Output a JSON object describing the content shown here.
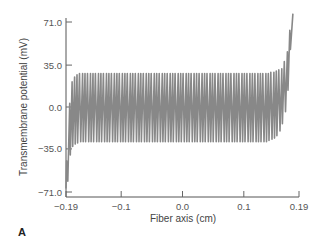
{
  "chart_data": {
    "type": "line",
    "title": "",
    "panel_label": "A",
    "xlabel": "Fiber axis (cm)",
    "ylabel": "Transmembrane potential (mV)",
    "xlim": [
      -0.19,
      0.19
    ],
    "ylim": [
      -71.0,
      71.0
    ],
    "x_ticks": [
      -0.19,
      -0.1,
      0.0,
      0.1,
      0.19
    ],
    "x_tick_labels": [
      "−0.19",
      "−0.1",
      "0.0",
      "0.1",
      "0.19"
    ],
    "y_ticks": [
      71.0,
      35.0,
      0.0,
      -35.0,
      -71.0
    ],
    "y_tick_labels": [
      "71.0",
      "35.0",
      "0.0",
      "−35.0",
      "−71.0"
    ],
    "grid": false,
    "legend": null,
    "line_color": "#888888",
    "series": [
      {
        "name": "Transmembrane potential",
        "points": [
          [
            -0.19,
            -68
          ],
          [
            -0.189,
            -45
          ],
          [
            -0.187,
            -62
          ],
          [
            -0.184,
            3
          ],
          [
            -0.183,
            -40
          ],
          [
            -0.18,
            21
          ],
          [
            -0.179,
            -33
          ],
          [
            -0.176,
            25
          ],
          [
            -0.175,
            -31
          ],
          [
            -0.172,
            27
          ],
          [
            -0.171,
            -30
          ],
          [
            -0.168,
            28
          ],
          [
            -0.166,
            -29
          ],
          [
            -0.163,
            28
          ],
          [
            -0.162,
            -29
          ],
          [
            -0.159,
            28
          ],
          [
            -0.158,
            -29
          ],
          [
            -0.155,
            28
          ],
          [
            -0.153,
            -29
          ],
          [
            -0.15,
            28
          ],
          [
            -0.149,
            -29
          ],
          [
            -0.146,
            28
          ],
          [
            -0.145,
            -29
          ],
          [
            -0.142,
            28
          ],
          [
            -0.14,
            -29
          ],
          [
            -0.137,
            28
          ],
          [
            -0.136,
            -29
          ],
          [
            -0.133,
            28
          ],
          [
            -0.132,
            -29
          ],
          [
            -0.129,
            28
          ],
          [
            -0.127,
            -29
          ],
          [
            -0.124,
            28
          ],
          [
            -0.123,
            -29
          ],
          [
            -0.12,
            28
          ],
          [
            -0.119,
            -29
          ],
          [
            -0.116,
            28
          ],
          [
            -0.114,
            -29
          ],
          [
            -0.111,
            28
          ],
          [
            -0.11,
            -29
          ],
          [
            -0.107,
            28
          ],
          [
            -0.106,
            -29
          ],
          [
            -0.103,
            28
          ],
          [
            -0.101,
            -29
          ],
          [
            -0.098,
            28
          ],
          [
            -0.097,
            -29
          ],
          [
            -0.094,
            28
          ],
          [
            -0.093,
            -29
          ],
          [
            -0.09,
            28
          ],
          [
            -0.088,
            -29
          ],
          [
            -0.085,
            28
          ],
          [
            -0.084,
            -29
          ],
          [
            -0.081,
            28
          ],
          [
            -0.08,
            -29
          ],
          [
            -0.077,
            28
          ],
          [
            -0.075,
            -29
          ],
          [
            -0.072,
            28
          ],
          [
            -0.071,
            -29
          ],
          [
            -0.068,
            28
          ],
          [
            -0.067,
            -29
          ],
          [
            -0.064,
            28
          ],
          [
            -0.062,
            -29
          ],
          [
            -0.059,
            28
          ],
          [
            -0.058,
            -29
          ],
          [
            -0.055,
            28
          ],
          [
            -0.054,
            -29
          ],
          [
            -0.051,
            28
          ],
          [
            -0.049,
            -29
          ],
          [
            -0.046,
            28
          ],
          [
            -0.045,
            -29
          ],
          [
            -0.042,
            28
          ],
          [
            -0.041,
            -29
          ],
          [
            -0.038,
            28
          ],
          [
            -0.036,
            -29
          ],
          [
            -0.033,
            28
          ],
          [
            -0.032,
            -29
          ],
          [
            -0.029,
            28
          ],
          [
            -0.028,
            -29
          ],
          [
            -0.025,
            28
          ],
          [
            -0.023,
            -29
          ],
          [
            -0.02,
            28
          ],
          [
            -0.019,
            -29
          ],
          [
            -0.016,
            28
          ],
          [
            -0.015,
            -29
          ],
          [
            -0.012,
            28
          ],
          [
            -0.01,
            -29
          ],
          [
            -0.007,
            28
          ],
          [
            -0.006,
            -29
          ],
          [
            -0.003,
            28
          ],
          [
            -0.002,
            -29
          ],
          [
            0.001,
            28
          ],
          [
            0.003,
            -29
          ],
          [
            0.006,
            28
          ],
          [
            0.007,
            -29
          ],
          [
            0.01,
            28
          ],
          [
            0.011,
            -29
          ],
          [
            0.014,
            28
          ],
          [
            0.016,
            -29
          ],
          [
            0.019,
            28
          ],
          [
            0.02,
            -29
          ],
          [
            0.023,
            28
          ],
          [
            0.024,
            -29
          ],
          [
            0.027,
            28
          ],
          [
            0.029,
            -29
          ],
          [
            0.032,
            28
          ],
          [
            0.033,
            -29
          ],
          [
            0.036,
            28
          ],
          [
            0.037,
            -29
          ],
          [
            0.04,
            28
          ],
          [
            0.042,
            -29
          ],
          [
            0.045,
            28
          ],
          [
            0.046,
            -29
          ],
          [
            0.049,
            28
          ],
          [
            0.05,
            -29
          ],
          [
            0.053,
            28
          ],
          [
            0.055,
            -29
          ],
          [
            0.058,
            28
          ],
          [
            0.059,
            -29
          ],
          [
            0.062,
            28
          ],
          [
            0.063,
            -29
          ],
          [
            0.066,
            28
          ],
          [
            0.068,
            -29
          ],
          [
            0.071,
            28
          ],
          [
            0.072,
            -29
          ],
          [
            0.075,
            28
          ],
          [
            0.076,
            -29
          ],
          [
            0.079,
            28
          ],
          [
            0.081,
            -29
          ],
          [
            0.084,
            28
          ],
          [
            0.085,
            -29
          ],
          [
            0.088,
            28
          ],
          [
            0.089,
            -29
          ],
          [
            0.092,
            28
          ],
          [
            0.094,
            -29
          ],
          [
            0.097,
            28
          ],
          [
            0.098,
            -29
          ],
          [
            0.101,
            28
          ],
          [
            0.102,
            -29
          ],
          [
            0.105,
            28
          ],
          [
            0.107,
            -29
          ],
          [
            0.11,
            28
          ],
          [
            0.111,
            -29
          ],
          [
            0.114,
            28
          ],
          [
            0.115,
            -29
          ],
          [
            0.118,
            28
          ],
          [
            0.12,
            -29
          ],
          [
            0.123,
            28
          ],
          [
            0.124,
            -29
          ],
          [
            0.127,
            28
          ],
          [
            0.128,
            -29
          ],
          [
            0.131,
            28
          ],
          [
            0.133,
            -29
          ],
          [
            0.136,
            28
          ],
          [
            0.137,
            -29
          ],
          [
            0.14,
            28
          ],
          [
            0.141,
            -28
          ],
          [
            0.144,
            29
          ],
          [
            0.146,
            -27
          ],
          [
            0.149,
            29
          ],
          [
            0.15,
            -26
          ],
          [
            0.153,
            30
          ],
          [
            0.154,
            -24
          ],
          [
            0.157,
            31
          ],
          [
            0.159,
            -20
          ],
          [
            0.162,
            32
          ],
          [
            0.163,
            -14
          ],
          [
            0.166,
            38
          ],
          [
            0.168,
            -4
          ],
          [
            0.171,
            46
          ],
          [
            0.172,
            14
          ],
          [
            0.175,
            64
          ],
          [
            0.176,
            48
          ],
          [
            0.18,
            78
          ]
        ]
      }
    ]
  }
}
